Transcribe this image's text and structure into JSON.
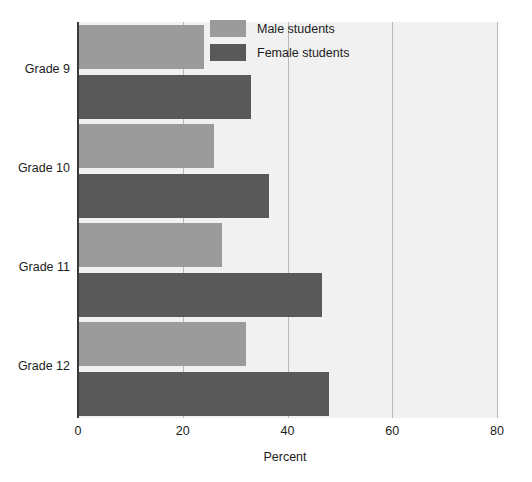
{
  "chart_data": {
    "type": "bar",
    "orientation": "horizontal",
    "title": "",
    "subtitle": "",
    "xlabel": "Percent",
    "ylabel": "",
    "categories": [
      "Grade 9",
      "Grade 10",
      "Grade 11",
      "Grade 12"
    ],
    "series": [
      {
        "name": "Male students",
        "color": "#9b9b9b",
        "values": [
          24,
          26,
          27.5,
          32
        ]
      },
      {
        "name": "Female students",
        "color": "#595959",
        "values": [
          33,
          36.5,
          46.5,
          48
        ]
      }
    ],
    "xlim": [
      0,
      80
    ],
    "xticks": [
      0,
      20,
      40,
      60,
      80
    ],
    "xtick_labels": [
      "0",
      "20",
      "40",
      "60",
      "80"
    ],
    "grid": true,
    "grid_axis": "x",
    "legend_position": "top-right-inside",
    "legend_entries": [
      "Male students",
      "Female students"
    ],
    "annotations": [],
    "plot_background": "#f1f1f1",
    "axis_color": "#3a3a3a",
    "gridline_color": "#b8b8b8",
    "text_color": "#1c1c1c"
  }
}
